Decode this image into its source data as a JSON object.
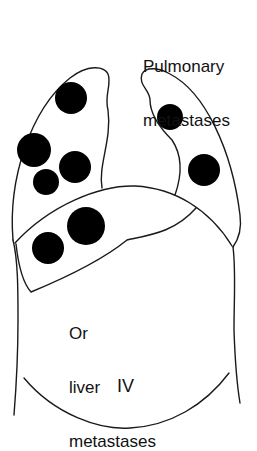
{
  "labels": {
    "pulmonary_line1": "Pulmonary",
    "pulmonary_line2": "metastases",
    "liver_line1": "Or",
    "liver_line2": "liver",
    "liver_line3": "metastases",
    "stage": "IV"
  },
  "colors": {
    "outline": "#1a1a1a",
    "lesion": "#000000",
    "background": "#ffffff"
  },
  "lesions": {
    "left_lung": [
      {
        "cx": 71,
        "cy": 98,
        "r": 16
      },
      {
        "cx": 34,
        "cy": 150,
        "r": 17
      },
      {
        "cx": 75,
        "cy": 167,
        "r": 16
      },
      {
        "cx": 46,
        "cy": 182,
        "r": 13
      }
    ],
    "right_lung": [
      {
        "cx": 170,
        "cy": 117,
        "r": 13
      },
      {
        "cx": 204,
        "cy": 170,
        "r": 16
      }
    ],
    "liver": [
      {
        "cx": 86,
        "cy": 226,
        "r": 19
      },
      {
        "cx": 48,
        "cy": 248,
        "r": 16
      }
    ]
  }
}
